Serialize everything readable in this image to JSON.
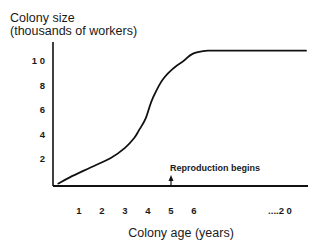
{
  "chart_data": {
    "type": "line",
    "title": "",
    "ylabel_line1": "Colony size",
    "ylabel_line2": "(thousands of workers)",
    "xlabel": "Colony age (years)",
    "xlim": [
      0,
      7
    ],
    "ylim": [
      0,
      11.5
    ],
    "grid": false,
    "legend": "none",
    "y_ticks": [
      {
        "value": 2,
        "label": "2"
      },
      {
        "value": 4,
        "label": "4"
      },
      {
        "value": 6,
        "label": "6"
      },
      {
        "value": 8,
        "label": "8"
      },
      {
        "value": 10,
        "label": "1 0"
      }
    ],
    "x_ticks": [
      {
        "value": 1,
        "label": "1"
      },
      {
        "value": 2,
        "label": "2"
      },
      {
        "value": 3,
        "label": "3"
      },
      {
        "value": 4,
        "label": "4"
      },
      {
        "value": 5,
        "label": "5"
      },
      {
        "value": 6,
        "label": "6"
      },
      {
        "value": 9.8,
        "label": "....2 0"
      }
    ],
    "series": [
      {
        "name": "Colony size",
        "x": [
          0.1,
          0.6,
          1.5,
          2.4,
          3.0,
          3.4,
          3.6,
          3.9,
          4.2,
          4.7,
          5.5,
          6.6,
          10.8
        ],
        "y": [
          0,
          0.5,
          1.3,
          2.1,
          2.9,
          3.7,
          4.3,
          5.3,
          6.9,
          8.6,
          9.9,
          10.8,
          10.8
        ],
        "color": "#111111"
      }
    ],
    "annotations": [
      {
        "text": "Reproduction begins",
        "x": 5,
        "arrow": "up"
      }
    ]
  }
}
